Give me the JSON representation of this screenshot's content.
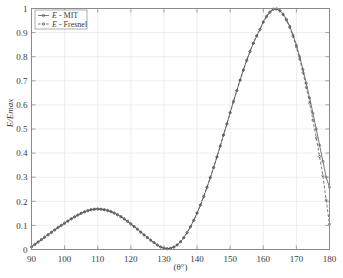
{
  "chart_data": {
    "type": "line",
    "title": "",
    "xlabel": "(θ°)",
    "ylabel": "E/Emax",
    "xlim": [
      90,
      180
    ],
    "ylim": [
      0,
      1
    ],
    "xticks": [
      90,
      100,
      110,
      120,
      130,
      140,
      150,
      160,
      170,
      180
    ],
    "yticks": [
      0,
      0.1,
      0.2,
      0.3,
      0.4,
      0.5,
      0.6,
      0.7,
      0.8,
      0.9,
      1
    ],
    "xtick_labels": [
      "90",
      "100",
      "110",
      "120",
      "130",
      "140",
      "150",
      "160",
      "170",
      "180"
    ],
    "ytick_labels": [
      "0",
      "0.1",
      "0.2",
      "0.3",
      "0.4",
      "0.5",
      "0.6",
      "0.7",
      "0.8",
      "0.9",
      "1"
    ],
    "grid": true,
    "legend_position": "top-left",
    "legend_entries": [
      "E - MIT",
      "E - Fresnel"
    ],
    "x": [
      90,
      91,
      92,
      93,
      94,
      95,
      96,
      97,
      98,
      99,
      100,
      101,
      102,
      103,
      104,
      105,
      106,
      107,
      108,
      109,
      110,
      111,
      112,
      113,
      114,
      115,
      116,
      117,
      118,
      119,
      120,
      121,
      122,
      123,
      124,
      125,
      126,
      127,
      128,
      129,
      130,
      131,
      132,
      133,
      134,
      135,
      136,
      137,
      138,
      139,
      140,
      141,
      142,
      143,
      144,
      145,
      146,
      147,
      148,
      149,
      150,
      151,
      152,
      153,
      154,
      155,
      156,
      157,
      158,
      159,
      160,
      161,
      162,
      163,
      164,
      165,
      166,
      167,
      168,
      169,
      170,
      171,
      172,
      173,
      174,
      175,
      176,
      177,
      178,
      179,
      180
    ],
    "series": [
      {
        "name": "E - MIT",
        "style": "solid",
        "marker": "circle",
        "color": "#4d4d4d",
        "values": [
          0.012,
          0.022,
          0.032,
          0.042,
          0.052,
          0.062,
          0.072,
          0.082,
          0.092,
          0.101,
          0.11,
          0.119,
          0.128,
          0.136,
          0.144,
          0.151,
          0.157,
          0.162,
          0.166,
          0.168,
          0.169,
          0.168,
          0.166,
          0.163,
          0.158,
          0.152,
          0.145,
          0.137,
          0.128,
          0.118,
          0.107,
          0.096,
          0.085,
          0.073,
          0.061,
          0.05,
          0.039,
          0.029,
          0.019,
          0.011,
          0.006,
          0.004,
          0.005,
          0.01,
          0.019,
          0.032,
          0.049,
          0.07,
          0.094,
          0.121,
          0.151,
          0.184,
          0.22,
          0.258,
          0.298,
          0.34,
          0.384,
          0.429,
          0.475,
          0.521,
          0.568,
          0.614,
          0.659,
          0.703,
          0.745,
          0.785,
          0.822,
          0.856,
          0.886,
          0.913,
          0.945,
          0.968,
          0.986,
          0.998,
          0.999,
          0.992,
          0.977,
          0.955,
          0.926,
          0.89,
          0.848,
          0.8,
          0.747,
          0.69,
          0.629,
          0.566,
          0.5,
          0.433,
          0.366,
          0.3,
          0.258
        ]
      },
      {
        "name": "E - Fresnel",
        "style": "dashed",
        "marker": "circle",
        "color": "#4d4d4d",
        "values": [
          0.01,
          0.02,
          0.03,
          0.04,
          0.05,
          0.06,
          0.07,
          0.08,
          0.09,
          0.099,
          0.108,
          0.117,
          0.126,
          0.134,
          0.142,
          0.149,
          0.155,
          0.16,
          0.164,
          0.166,
          0.167,
          0.166,
          0.164,
          0.161,
          0.156,
          0.15,
          0.143,
          0.135,
          0.126,
          0.116,
          0.105,
          0.094,
          0.083,
          0.071,
          0.06,
          0.049,
          0.038,
          0.028,
          0.018,
          0.01,
          0.005,
          0.003,
          0.005,
          0.01,
          0.019,
          0.032,
          0.049,
          0.07,
          0.094,
          0.121,
          0.151,
          0.184,
          0.22,
          0.258,
          0.298,
          0.34,
          0.384,
          0.429,
          0.475,
          0.521,
          0.568,
          0.614,
          0.659,
          0.703,
          0.745,
          0.785,
          0.822,
          0.856,
          0.886,
          0.913,
          0.943,
          0.966,
          0.984,
          0.996,
          0.997,
          0.99,
          0.974,
          0.951,
          0.921,
          0.884,
          0.84,
          0.79,
          0.734,
          0.673,
          0.607,
          0.537,
          0.463,
          0.386,
          0.306,
          0.205,
          0.105
        ]
      }
    ]
  }
}
